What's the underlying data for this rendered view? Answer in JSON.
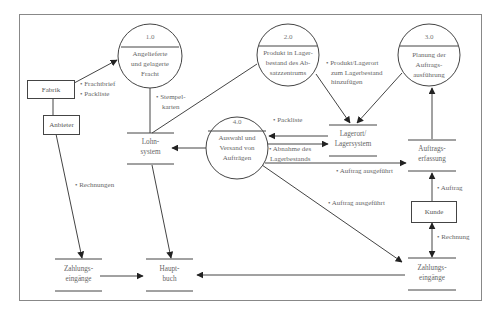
{
  "diagram": {
    "type": "data-flow-diagram",
    "processes": [
      {
        "id": "1.0",
        "label": "Angelieferte und gelagerte Fracht",
        "lines": [
          "Angelieferte",
          "und gelagerte",
          "Fracht"
        ]
      },
      {
        "id": "2.0",
        "label": "Produkt in Lagerbestand des Absatzzentrums",
        "lines": [
          "Produkt in Lager-",
          "bestand des Ab-",
          "satzzentrums"
        ]
      },
      {
        "id": "3.0",
        "label": "Planung der Auftragsausführung",
        "lines": [
          "Planung der",
          "Auftrags-",
          "ausführung"
        ]
      },
      {
        "id": "4.0",
        "label": "Auswahl und Versand von Aufträgen",
        "lines": [
          "Auswahl und",
          "Versand von",
          "Aufträgen"
        ]
      }
    ],
    "external_entities": [
      {
        "id": "fabrik",
        "label": "Fabrik"
      },
      {
        "id": "anbieter",
        "label": "Anbieter"
      },
      {
        "id": "kunde",
        "label": "Kunde"
      }
    ],
    "data_stores": [
      {
        "id": "lohnsystem",
        "lines": [
          "Lohn-",
          "system"
        ]
      },
      {
        "id": "lagerort",
        "lines": [
          "Lagerort/",
          "Lagersystem"
        ]
      },
      {
        "id": "auftragserfassung",
        "lines": [
          "Auftrags-",
          "erfassung"
        ]
      },
      {
        "id": "zahlungseingaenge_left",
        "lines": [
          "Zahlungs-",
          "eingänge"
        ]
      },
      {
        "id": "hauptbuch",
        "lines": [
          "Haupt-",
          "buch"
        ]
      },
      {
        "id": "zahlungseingaenge_right",
        "lines": [
          "Zahlungs-",
          "eingänge"
        ]
      }
    ],
    "flows": [
      {
        "from": "Fabrik",
        "to": "1.0",
        "labels": [
          "• Frachtbrief",
          "• Packliste"
        ]
      },
      {
        "from": "1.0",
        "to": "Lohnsystem",
        "labels": [
          "• Stempel-",
          "karten"
        ]
      },
      {
        "from": "2.0",
        "to": "Lohnsystem",
        "labels": []
      },
      {
        "from": "2.0",
        "to": "Lagerort/Lagersystem",
        "labels": [
          "• Produkt/Lagerort",
          "zum Lagerbestand",
          "hinzufügen"
        ]
      },
      {
        "from": "3.0",
        "to": "Lagerort/Lagersystem",
        "labels": []
      },
      {
        "from": "Auftragserfassung",
        "to": "3.0",
        "labels": []
      },
      {
        "from": "Lagerort/Lagersystem",
        "to": "4.0",
        "labels": [
          "• Packliste"
        ]
      },
      {
        "from": "4.0",
        "to": "Lagerort/Lagersystem",
        "labels": [
          "• Abnahme des",
          "Lagerbestands"
        ]
      },
      {
        "from": "4.0",
        "to": "Lohnsystem",
        "labels": []
      },
      {
        "from": "4.0",
        "to": "Auftragserfassung",
        "labels": [
          "• Auftrag ausgeführt"
        ]
      },
      {
        "from": "4.0",
        "to": "Zahlungseingänge (right)",
        "labels": [
          "• Auftrag ausgeführt"
        ]
      },
      {
        "from": "Kunde",
        "to": "Auftragserfassung",
        "labels": [
          "• Auftrag"
        ]
      },
      {
        "from": "Kunde",
        "to": "Zahlungseingänge (right)",
        "labels": [
          "• Rechnung"
        ],
        "bidirectional": true
      },
      {
        "from": "Anbieter",
        "to": "Zahlungseingänge (left)",
        "labels": [
          "• Rechnungen"
        ]
      },
      {
        "from": "Lohnsystem",
        "to": "Hauptbuch",
        "labels": []
      },
      {
        "from": "Zahlungseingänge (left)",
        "to": "Hauptbuch",
        "labels": []
      },
      {
        "from": "Zahlungseingänge (right)",
        "to": "Hauptbuch",
        "labels": []
      }
    ]
  },
  "labels": {
    "p1_num": "1.0",
    "p1_l1": "Angelieferte",
    "p1_l2": "und gelagerte",
    "p1_l3": "Fracht",
    "p2_num": "2.0",
    "p2_l1": "Produkt in Lager-",
    "p2_l2": "bestand des Ab-",
    "p2_l3": "satzzentrums",
    "p3_num": "3.0",
    "p3_l1": "Planung der",
    "p3_l2": "Auftrags-",
    "p3_l3": "ausführung",
    "p4_num": "4.0",
    "p4_l1": "Auswahl und",
    "p4_l2": "Versand von",
    "p4_l3": "Aufträgen",
    "fabrik": "Fabrik",
    "anbieter": "Anbieter",
    "kunde": "Kunde",
    "lohn_l1": "Lohn-",
    "lohn_l2": "system",
    "lager_l1": "Lagerort/",
    "lager_l2": "Lagersystem",
    "auftr_l1": "Auftrags-",
    "auftr_l2": "erfassung",
    "zahl1_l1": "Zahlungs-",
    "zahl1_l2": "eingänge",
    "haupt_l1": "Haupt-",
    "haupt_l2": "buch",
    "zahl2_l1": "Zahlungs-",
    "zahl2_l2": "eingänge",
    "f_frachtbrief": "• Frachtbrief",
    "f_packliste1": "• Packliste",
    "f_stempel1": "• Stempel-",
    "f_stempel2": "karten",
    "f_produkt1": "• Produkt/Lagerort",
    "f_produkt2": "zum Lagerbestand",
    "f_produkt3": "hinzufügen",
    "f_packliste2": "• Packliste",
    "f_abnahme1": "• Abnahme des",
    "f_abnahme2": "Lagerbestands",
    "f_auftrag_ausg1": "• Auftrag ausgeführt",
    "f_auftrag_ausg2": "• Auftrag ausgeführt",
    "f_auftrag": "• Auftrag",
    "f_rechnung": "• Rechnung",
    "f_rechnungen": "• Rechnungen"
  },
  "colors": {
    "line": "#444444",
    "frame": "#777777",
    "text": "#666666",
    "background": "#ffffff"
  }
}
